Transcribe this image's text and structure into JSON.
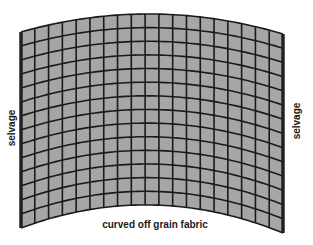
{
  "diagram": {
    "caption": "curved off grain fabric",
    "left_label": "selvage",
    "right_label": "selvage",
    "grid": {
      "columns": 19,
      "rows": 14,
      "cell_fill": "#a6a6a6",
      "line_color": "#1a1a1a",
      "selvage_color": "#222222"
    },
    "shape": {
      "top_left": [
        21,
        32
      ],
      "top_mid": [
        152,
        14
      ],
      "top_right": [
        283,
        34
      ],
      "bottom_left": [
        21,
        228
      ],
      "bottom_mid": [
        152,
        205
      ],
      "bottom_right": [
        283,
        233
      ]
    }
  }
}
